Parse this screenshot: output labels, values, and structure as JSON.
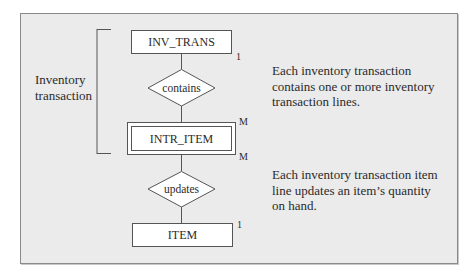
{
  "diagram": {
    "type": "er-diagram",
    "group_label": {
      "line1": "Inventory",
      "line2": "transaction"
    },
    "entities": [
      {
        "id": "inv_trans",
        "label": "INV_TRANS",
        "weak": false
      },
      {
        "id": "intr_item",
        "label": "INTR_ITEM",
        "weak": true
      },
      {
        "id": "item",
        "label": "ITEM",
        "weak": false
      }
    ],
    "relationships": [
      {
        "id": "contains",
        "label": "contains",
        "from": "INV_TRANS",
        "to": "INTR_ITEM",
        "from_card": "1",
        "to_card": "M"
      },
      {
        "id": "updates",
        "label": "updates",
        "from": "INTR_ITEM",
        "to": "ITEM",
        "from_card": "M",
        "to_card": "1"
      }
    ],
    "cardinalities": {
      "inv_trans": "1",
      "intr_item_top": "M",
      "intr_item_bottom": "M",
      "item": "1"
    },
    "descriptions": [
      {
        "line1": "Each inventory transaction",
        "line2": "contains one or more inventory",
        "line3": "transaction lines."
      },
      {
        "line1": "Each inventory transaction item",
        "line2": "line updates an item’s quantity",
        "line3": "on hand."
      }
    ],
    "colors": {
      "background": "#ebebeb",
      "entity_fill": "#ffffff",
      "stroke": "#555555",
      "text": "#2a2a2a"
    }
  }
}
